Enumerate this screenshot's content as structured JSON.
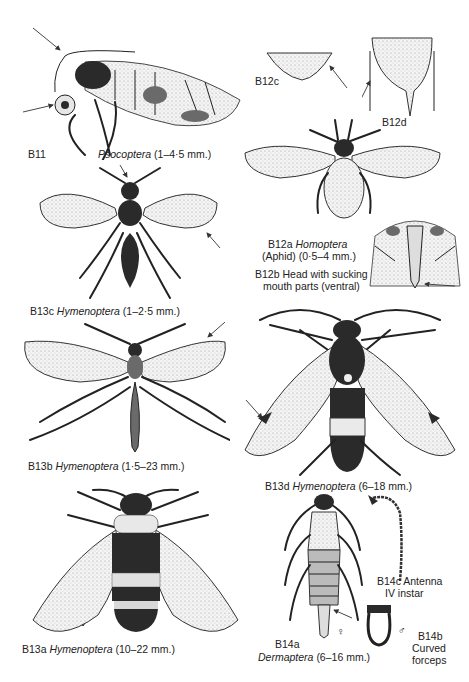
{
  "page": {
    "background": "#ffffff",
    "ink": "#1a1a1a"
  },
  "figures": [
    {
      "id": "B11",
      "code": "B11",
      "order": "Psocoptera",
      "size": "(1–4·5 mm.)"
    },
    {
      "id": "B12c",
      "code": "B12c"
    },
    {
      "id": "B12d",
      "code": "B12d"
    },
    {
      "id": "B12a",
      "code": "B12a",
      "order": "Homoptera",
      "common": "(Aphid)",
      "size": "(0·5–4 mm.)"
    },
    {
      "id": "B12b",
      "code": "B12b",
      "caption_line1": "Head with sucking",
      "caption_line2": "mouth parts (ventral)"
    },
    {
      "id": "B13c",
      "code": "B13c",
      "order": "Hymenoptera",
      "size": "(1–2·5 mm.)"
    },
    {
      "id": "B13b",
      "code": "B13b",
      "order": "Hymenoptera",
      "size": "(1·5–23 mm.)"
    },
    {
      "id": "B13d",
      "code": "B13d",
      "order": "Hymenoptera",
      "size": "(6–18 mm.)"
    },
    {
      "id": "B13a",
      "code": "B13a",
      "order": "Hymenoptera",
      "size": "(10–22 mm.)"
    },
    {
      "id": "B14a",
      "code": "B14a",
      "order": "Dermaptera",
      "size": "(6–16 mm.)",
      "sex_symbol": "♀"
    },
    {
      "id": "B14b",
      "code": "B14b",
      "caption_line1": "Curved",
      "caption_line2": "forceps",
      "sex_symbol": "♂"
    },
    {
      "id": "B14c",
      "code": "B14c",
      "caption_line1": "Antenna",
      "caption_line2": "IV instar"
    }
  ]
}
